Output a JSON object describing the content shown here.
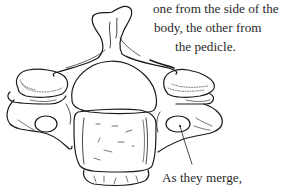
{
  "figure": {
    "style": "black line art on white",
    "stroke_color": "#1a1a1a",
    "background_color": "#ffffff"
  },
  "caption_top": {
    "lines": [
      "one from the side of the",
      "body, the other from",
      "the pedicle."
    ]
  },
  "caption_bottom": {
    "lines": [
      "As they merge,"
    ]
  }
}
